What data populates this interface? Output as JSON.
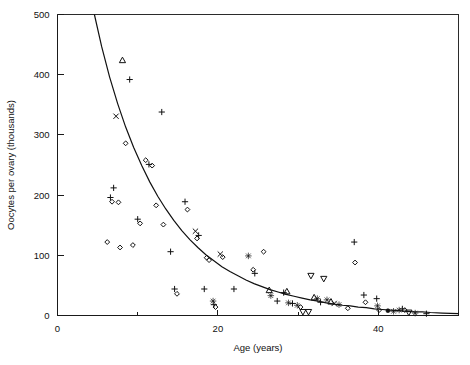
{
  "chart_data": {
    "type": "scatter",
    "title": "",
    "xlabel": "Age (years)",
    "ylabel": "Oocytes per ovary (thousands)",
    "xlim": [
      0,
      50
    ],
    "ylim": [
      0,
      500
    ],
    "xticks": [
      0,
      10,
      20,
      30,
      40,
      50
    ],
    "xtick_labels": [
      "0",
      "",
      "20",
      "",
      "40",
      ""
    ],
    "yticks": [
      0,
      100,
      200,
      300,
      400,
      500
    ],
    "ytick_labels": [
      "0",
      "100",
      "200",
      "300",
      "400",
      "500"
    ],
    "grid": false,
    "legend": "none",
    "frame": "full-box",
    "marker_kinds": [
      "plus",
      "diamond",
      "cross",
      "triangle-up",
      "triangle-down",
      "star-filled",
      "circle-filled"
    ],
    "series": [
      {
        "name": "Oocyte counts",
        "marker": "mixed",
        "points": [
          {
            "x": 6.2,
            "y": 122,
            "marker": "diamond"
          },
          {
            "x": 6.6,
            "y": 196,
            "marker": "plus"
          },
          {
            "x": 6.8,
            "y": 189,
            "marker": "diamond"
          },
          {
            "x": 7.0,
            "y": 212,
            "marker": "plus"
          },
          {
            "x": 7.3,
            "y": 331,
            "marker": "cross"
          },
          {
            "x": 7.6,
            "y": 188,
            "marker": "diamond"
          },
          {
            "x": 7.8,
            "y": 113,
            "marker": "diamond"
          },
          {
            "x": 8.1,
            "y": 424,
            "marker": "triangle-up"
          },
          {
            "x": 8.5,
            "y": 286,
            "marker": "diamond"
          },
          {
            "x": 9.0,
            "y": 392,
            "marker": "plus"
          },
          {
            "x": 9.4,
            "y": 117,
            "marker": "diamond"
          },
          {
            "x": 10.0,
            "y": 160,
            "marker": "plus"
          },
          {
            "x": 10.3,
            "y": 153,
            "marker": "diamond"
          },
          {
            "x": 11.0,
            "y": 258,
            "marker": "diamond"
          },
          {
            "x": 11.4,
            "y": 251,
            "marker": "plus"
          },
          {
            "x": 11.8,
            "y": 249,
            "marker": "diamond"
          },
          {
            "x": 12.3,
            "y": 183,
            "marker": "diamond"
          },
          {
            "x": 13.0,
            "y": 338,
            "marker": "plus"
          },
          {
            "x": 13.2,
            "y": 151,
            "marker": "diamond"
          },
          {
            "x": 14.1,
            "y": 106,
            "marker": "plus"
          },
          {
            "x": 14.6,
            "y": 44,
            "marker": "plus"
          },
          {
            "x": 14.9,
            "y": 36,
            "marker": "diamond"
          },
          {
            "x": 15.9,
            "y": 189,
            "marker": "plus"
          },
          {
            "x": 16.2,
            "y": 176,
            "marker": "diamond"
          },
          {
            "x": 17.2,
            "y": 140,
            "marker": "cross"
          },
          {
            "x": 17.4,
            "y": 128,
            "marker": "diamond"
          },
          {
            "x": 17.6,
            "y": 133,
            "marker": "plus"
          },
          {
            "x": 18.3,
            "y": 44,
            "marker": "plus"
          },
          {
            "x": 18.6,
            "y": 96,
            "marker": "diamond"
          },
          {
            "x": 18.9,
            "y": 92,
            "marker": "diamond"
          },
          {
            "x": 19.4,
            "y": 24,
            "marker": "star-filled"
          },
          {
            "x": 19.5,
            "y": 18,
            "marker": "plus"
          },
          {
            "x": 19.7,
            "y": 14,
            "marker": "diamond"
          },
          {
            "x": 20.3,
            "y": 102,
            "marker": "cross"
          },
          {
            "x": 20.6,
            "y": 97,
            "marker": "diamond"
          },
          {
            "x": 22.0,
            "y": 44,
            "marker": "plus"
          },
          {
            "x": 23.8,
            "y": 99,
            "marker": "star-filled"
          },
          {
            "x": 24.4,
            "y": 76,
            "marker": "diamond"
          },
          {
            "x": 24.6,
            "y": 70,
            "marker": "plus"
          },
          {
            "x": 25.7,
            "y": 106,
            "marker": "diamond"
          },
          {
            "x": 26.4,
            "y": 42,
            "marker": "triangle-up"
          },
          {
            "x": 26.6,
            "y": 33,
            "marker": "star-filled"
          },
          {
            "x": 27.4,
            "y": 24,
            "marker": "plus"
          },
          {
            "x": 28.2,
            "y": 38,
            "marker": "plus"
          },
          {
            "x": 28.6,
            "y": 40,
            "marker": "triangle-up"
          },
          {
            "x": 28.8,
            "y": 21,
            "marker": "star-filled"
          },
          {
            "x": 29.3,
            "y": 20,
            "marker": "plus"
          },
          {
            "x": 29.9,
            "y": 17,
            "marker": "star-filled"
          },
          {
            "x": 30.3,
            "y": 14,
            "marker": "diamond"
          },
          {
            "x": 30.6,
            "y": 6,
            "marker": "triangle-down"
          },
          {
            "x": 31.3,
            "y": 6,
            "marker": "triangle-down"
          },
          {
            "x": 31.6,
            "y": 66,
            "marker": "triangle-down"
          },
          {
            "x": 32.0,
            "y": 30,
            "marker": "triangle-up"
          },
          {
            "x": 32.4,
            "y": 28,
            "marker": "star-filled"
          },
          {
            "x": 32.8,
            "y": 22,
            "marker": "plus"
          },
          {
            "x": 33.2,
            "y": 61,
            "marker": "triangle-down"
          },
          {
            "x": 33.6,
            "y": 26,
            "marker": "star-filled"
          },
          {
            "x": 34.1,
            "y": 23,
            "marker": "triangle-up"
          },
          {
            "x": 34.5,
            "y": 20,
            "marker": "cross"
          },
          {
            "x": 35.1,
            "y": 18,
            "marker": "star-filled"
          },
          {
            "x": 36.2,
            "y": 12,
            "marker": "diamond"
          },
          {
            "x": 37.0,
            "y": 122,
            "marker": "plus"
          },
          {
            "x": 37.1,
            "y": 88,
            "marker": "diamond"
          },
          {
            "x": 38.2,
            "y": 34,
            "marker": "plus"
          },
          {
            "x": 38.4,
            "y": 22,
            "marker": "diamond"
          },
          {
            "x": 39.8,
            "y": 28,
            "marker": "plus"
          },
          {
            "x": 39.9,
            "y": 16,
            "marker": "star-filled"
          },
          {
            "x": 40.1,
            "y": 9,
            "marker": "diamond"
          },
          {
            "x": 41.2,
            "y": 8,
            "marker": "circle-filled"
          },
          {
            "x": 41.9,
            "y": 7,
            "marker": "star-filled"
          },
          {
            "x": 42.6,
            "y": 9,
            "marker": "star-filled"
          },
          {
            "x": 43.0,
            "y": 11,
            "marker": "plus"
          },
          {
            "x": 43.3,
            "y": 9,
            "marker": "diamond"
          },
          {
            "x": 43.8,
            "y": 5,
            "marker": "triangle-down"
          },
          {
            "x": 44.6,
            "y": 4,
            "marker": "star-filled"
          },
          {
            "x": 46.0,
            "y": 3,
            "marker": "plus"
          }
        ]
      }
    ],
    "fit_curve": {
      "name": "fitted decline curve",
      "style": "solid",
      "points": [
        {
          "x": 4.6,
          "y": 500
        },
        {
          "x": 5.5,
          "y": 447
        },
        {
          "x": 6.5,
          "y": 396
        },
        {
          "x": 7.5,
          "y": 352
        },
        {
          "x": 8.5,
          "y": 313
        },
        {
          "x": 9.5,
          "y": 279
        },
        {
          "x": 10.5,
          "y": 249
        },
        {
          "x": 11.5,
          "y": 222
        },
        {
          "x": 12.5,
          "y": 198
        },
        {
          "x": 13.5,
          "y": 177
        },
        {
          "x": 14.5,
          "y": 158
        },
        {
          "x": 15.5,
          "y": 141
        },
        {
          "x": 16.5,
          "y": 126
        },
        {
          "x": 17.5,
          "y": 113
        },
        {
          "x": 18.5,
          "y": 101
        },
        {
          "x": 19.5,
          "y": 91
        },
        {
          "x": 20.5,
          "y": 81
        },
        {
          "x": 21.5,
          "y": 73
        },
        {
          "x": 22.5,
          "y": 66
        },
        {
          "x": 23.5,
          "y": 59
        },
        {
          "x": 24.5,
          "y": 53
        },
        {
          "x": 25.5,
          "y": 48
        },
        {
          "x": 26.5,
          "y": 43
        },
        {
          "x": 27.5,
          "y": 39
        },
        {
          "x": 28.5,
          "y": 35
        },
        {
          "x": 29.5,
          "y": 32
        },
        {
          "x": 30.5,
          "y": 29
        },
        {
          "x": 31.5,
          "y": 26
        },
        {
          "x": 32.5,
          "y": 24
        },
        {
          "x": 33.5,
          "y": 21
        },
        {
          "x": 34.5,
          "y": 19
        },
        {
          "x": 35.5,
          "y": 17
        },
        {
          "x": 36.5,
          "y": 16
        },
        {
          "x": 37.5,
          "y": 14
        },
        {
          "x": 38.5,
          "y": 13
        },
        {
          "x": 39.5,
          "y": 11
        },
        {
          "x": 40.5,
          "y": 10
        },
        {
          "x": 41.5,
          "y": 9
        },
        {
          "x": 42.5,
          "y": 8
        },
        {
          "x": 43.5,
          "y": 7
        },
        {
          "x": 44.5,
          "y": 6
        },
        {
          "x": 45.5,
          "y": 6
        },
        {
          "x": 46.5,
          "y": 5
        },
        {
          "x": 48.0,
          "y": 4
        },
        {
          "x": 50.0,
          "y": 3
        }
      ]
    }
  }
}
